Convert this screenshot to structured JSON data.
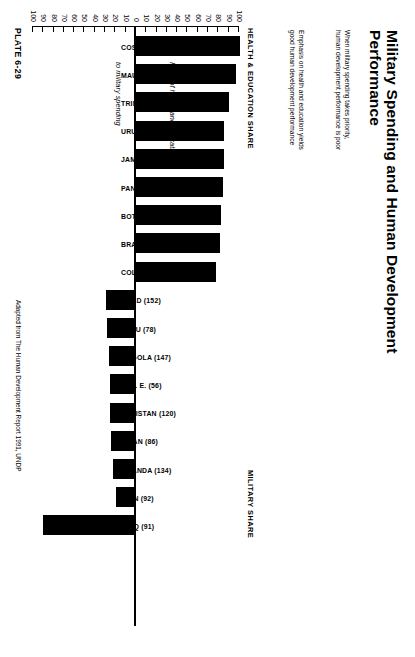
{
  "title": "Military Spending and Human Development Performance",
  "notes": {
    "military": "When military spending takes priority,\nhuman development performance is poor",
    "health": "Emphasis on health and education yields\ngood human development performance"
  },
  "category_labels": {
    "left": "HEALTH & EDUCATION SHARE",
    "right": "MILITARY SHARE"
  },
  "axis_title": {
    "upper": "Ratio of health and education",
    "lower": "to military spending"
  },
  "plate": "PLATE 6-29",
  "source": "Adapted from The Human Development Report 1991, UNDP",
  "chart_data": {
    "type": "bar",
    "title": "Military Spending and Human Development Performance",
    "xlabel": "",
    "ylabel": "Ratio of health and education to military spending",
    "ylim": [
      -100,
      100
    ],
    "yticks": [
      100,
      90,
      80,
      70,
      60,
      50,
      40,
      30,
      20,
      10,
      0,
      10,
      20,
      30,
      40,
      50,
      60,
      70,
      80,
      90,
      100
    ],
    "grid": false,
    "legend": "none",
    "orientation": "vertical-diverging",
    "categories": [
      "COSTA RICA (40)",
      "MAURITIUS (47)",
      "TRINIDAD & TOBAGO (39)",
      "URUGUAY (32)",
      "JAMAICA (59)",
      "PANAMA (54)",
      "BOTSWANA (95)",
      "BRAZIL (60)",
      "COLOMBIA (61)",
      "CHAD (152)",
      "PERU (78)",
      "ANGOLA (147)",
      "U. A. E. (56)",
      "PAKISTAN (120)",
      "OMAN (86)",
      "UGANDA (134)",
      "IRAN (92)",
      "IRAQ (91)"
    ],
    "values": [
      101,
      97,
      90,
      85,
      85,
      84,
      83,
      82,
      78,
      -29,
      -28,
      -26,
      -25,
      -25,
      -24,
      -22,
      -19,
      -90
    ],
    "series": [
      {
        "name": "Health & education share",
        "values": [
          101,
          97,
          90,
          85,
          85,
          84,
          83,
          82,
          78,
          null,
          null,
          null,
          null,
          null,
          null,
          null,
          null,
          null
        ]
      },
      {
        "name": "Military share",
        "values": [
          null,
          null,
          null,
          null,
          null,
          null,
          null,
          null,
          null,
          29,
          28,
          26,
          25,
          25,
          24,
          22,
          19,
          90
        ]
      }
    ],
    "annotations": [
      "When military spending takes priority, human development performance is poor",
      "Emphasis on health and education yields good human development performance"
    ]
  }
}
